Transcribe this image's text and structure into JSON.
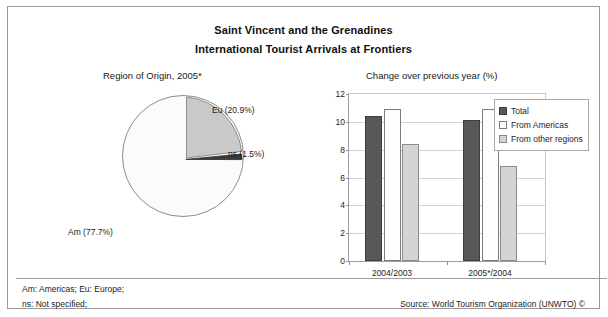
{
  "header": {
    "title_line_1": "Saint Vincent and the Grenadines",
    "title_line_2": "International Tourist Arrivals at Frontiers"
  },
  "footer": {
    "note_1": "Am: Americas; Eu: Europe;",
    "note_2": "ns: Not specified;",
    "source": "Source: World Tourism Organization (UNWTO) ©"
  },
  "colors": {
    "total": "#585858",
    "from_americas": "#fdfdfd",
    "from_other_regions": "#d4d4d4",
    "pie_eu": "#c9c9c9",
    "pie_am": "#fbfbfb",
    "pie_ns": "#3a3a3a",
    "frame": "#9a9a9a",
    "grid": "#d2d2d2"
  },
  "chart_data": [
    {
      "type": "pie",
      "title": "Region of Origin, 2005*",
      "xlabel": "",
      "ylabel": "",
      "legend_position": "none",
      "labels": [
        "Eu",
        "Am",
        "ns"
      ],
      "values": [
        20.9,
        77.7,
        1.5
      ],
      "value_unit": "%",
      "data_labels": [
        "Eu (20.9%)",
        "Am (77.7%)",
        "ns (1.5%)"
      ],
      "slice_colors": [
        "#c9c9c9",
        "#fbfbfb",
        "#3a3a3a"
      ],
      "exploded": [
        "Eu",
        "ns"
      ]
    },
    {
      "type": "bar",
      "title": "Change over previous year (%)",
      "xlabel": "",
      "ylabel": "",
      "categories": [
        "2004/2003",
        "2005*/2004"
      ],
      "series": [
        {
          "name": "Total",
          "values": [
            10.4,
            10.1
          ]
        },
        {
          "name": "From Americas",
          "values": [
            10.9,
            10.95
          ]
        },
        {
          "name": "From other regions",
          "values": [
            8.4,
            6.8
          ]
        }
      ],
      "ylim": [
        0,
        12
      ],
      "yticks": [
        0,
        2,
        4,
        6,
        8,
        10,
        12
      ],
      "ytick_labels": [
        "0",
        "2",
        "4",
        "6",
        "8",
        "10",
        "12"
      ],
      "grid": true,
      "legend_position": "top-right"
    }
  ]
}
